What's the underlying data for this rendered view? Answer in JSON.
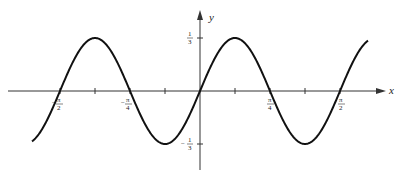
{
  "chart_data": {
    "type": "line",
    "title": "",
    "function": "y = (1/3) sin(4x)",
    "xlabel": "x",
    "ylabel": "y",
    "xlim": [
      -1.885,
      1.885
    ],
    "ylim": [
      -0.38,
      0.38
    ],
    "x_ticks": [
      {
        "value": -1.5708,
        "label": "-π/2"
      },
      {
        "value": -1.1781,
        "label": ""
      },
      {
        "value": -0.7854,
        "label": "-π/4"
      },
      {
        "value": -0.3927,
        "label": ""
      },
      {
        "value": 0.3927,
        "label": ""
      },
      {
        "value": 0.7854,
        "label": "π/4"
      },
      {
        "value": 1.1781,
        "label": ""
      },
      {
        "value": 1.5708,
        "label": "π/2"
      }
    ],
    "y_ticks": [
      {
        "value": 0.3333,
        "label": "1/3"
      },
      {
        "value": -0.3333,
        "label": "-1/3"
      }
    ],
    "series": [
      {
        "name": "y = (1/3) sin 4x",
        "x_range": [
          -1.885,
          1.885
        ],
        "amplitude": 0.3333,
        "period": 1.5708
      }
    ],
    "grid": false,
    "legend": "none"
  },
  "labels": {
    "x_axis": "x",
    "y_axis": "y",
    "neg_pi_2": {
      "sign": "−",
      "num": "π",
      "den": "2"
    },
    "neg_pi_4": {
      "sign": "−",
      "num": "π",
      "den": "4"
    },
    "pi_4": {
      "num": "π",
      "den": "4"
    },
    "pi_2": {
      "num": "π",
      "den": "2"
    },
    "y_top": {
      "num": "1",
      "den": "3"
    },
    "y_bot": {
      "sign": "−",
      "num": "1",
      "den": "3"
    }
  }
}
